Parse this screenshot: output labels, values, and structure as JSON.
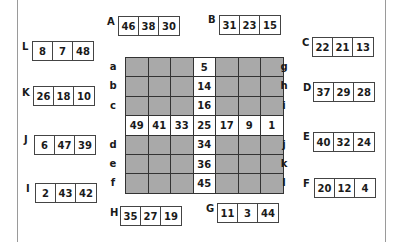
{
  "puzzle": {
    "boxes": [
      {
        "id": "A",
        "values": [
          "46",
          "38",
          "30"
        ],
        "label_x": 107,
        "label_y": 17,
        "x": 118,
        "y": 16
      },
      {
        "id": "B",
        "values": [
          "31",
          "23",
          "15"
        ],
        "label_x": 208,
        "label_y": 15,
        "x": 219,
        "y": 15
      },
      {
        "id": "C",
        "values": [
          "22",
          "21",
          "13"
        ],
        "label_x": 302,
        "label_y": 38,
        "x": 312,
        "y": 37
      },
      {
        "id": "D",
        "values": [
          "37",
          "29",
          "28"
        ],
        "label_x": 303,
        "label_y": 83,
        "x": 313,
        "y": 82
      },
      {
        "id": "E",
        "values": [
          "40",
          "32",
          "24"
        ],
        "label_x": 303,
        "label_y": 132,
        "x": 313,
        "y": 132
      },
      {
        "id": "F",
        "values": [
          "20",
          "12",
          "4"
        ],
        "label_x": 303,
        "label_y": 179,
        "x": 314,
        "y": 178
      },
      {
        "id": "G",
        "values": [
          "11",
          "3",
          "44"
        ],
        "label_x": 206,
        "label_y": 204,
        "x": 217,
        "y": 203
      },
      {
        "id": "H",
        "values": [
          "35",
          "27",
          "19"
        ],
        "label_x": 110,
        "label_y": 208,
        "x": 120,
        "y": 206
      },
      {
        "id": "I",
        "values": [
          "2",
          "43",
          "42"
        ],
        "label_x": 26,
        "label_y": 184,
        "x": 35,
        "y": 183
      },
      {
        "id": "J",
        "values": [
          "6",
          "47",
          "39"
        ],
        "label_x": 24,
        "label_y": 135,
        "x": 34,
        "y": 135
      },
      {
        "id": "K",
        "values": [
          "26",
          "18",
          "10"
        ],
        "label_x": 22,
        "label_y": 88,
        "x": 33,
        "y": 86
      },
      {
        "id": "L",
        "values": [
          "8",
          "7",
          "48"
        ],
        "label_x": 22,
        "label_y": 42,
        "x": 32,
        "y": 41
      }
    ],
    "grid": {
      "rows": [
        [
          "",
          "",
          "",
          "5",
          "",
          "",
          ""
        ],
        [
          "",
          "",
          "",
          "14",
          "",
          "",
          ""
        ],
        [
          "",
          "",
          "",
          "16",
          "",
          "",
          ""
        ],
        [
          "49",
          "41",
          "33",
          "25",
          "17",
          "9",
          "1"
        ],
        [
          "",
          "",
          "",
          "34",
          "",
          "",
          ""
        ],
        [
          "",
          "",
          "",
          "36",
          "",
          "",
          ""
        ],
        [
          "",
          "",
          "",
          "45",
          "",
          "",
          ""
        ]
      ],
      "left_labels": [
        "a",
        "b",
        "c",
        "",
        "d",
        "e",
        "f"
      ],
      "right_labels": [
        "g",
        "h",
        "i",
        "",
        "j",
        "k",
        "l"
      ]
    }
  }
}
